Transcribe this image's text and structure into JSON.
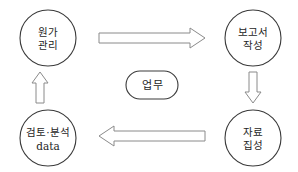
{
  "diagram": {
    "type": "cycle-flow",
    "center": {
      "label": "업무",
      "shape": "stadium"
    },
    "nodes": [
      {
        "id": "cost-management",
        "position": "top-left",
        "lines": [
          "원가",
          "관리"
        ],
        "line1": "원가",
        "line2": "관리",
        "shape": "circle"
      },
      {
        "id": "report-writing",
        "position": "top-right",
        "lines": [
          "보고서",
          "작성"
        ],
        "line1": "보고서",
        "line2": "작성",
        "shape": "circle"
      },
      {
        "id": "data-compilation",
        "position": "bottom-right",
        "lines": [
          "자료",
          "집성"
        ],
        "line1": "자료",
        "line2": "집성",
        "shape": "circle"
      },
      {
        "id": "review-analysis-data",
        "position": "bottom-left",
        "lines": [
          "검토·분석",
          "data"
        ],
        "line1": "검토·분석",
        "line2": "data",
        "shape": "circle"
      }
    ],
    "arrows": [
      {
        "id": "arrow-top",
        "direction": "right",
        "from": "cost-management",
        "to": "report-writing"
      },
      {
        "id": "arrow-right",
        "direction": "down",
        "from": "report-writing",
        "to": "data-compilation"
      },
      {
        "id": "arrow-bottom",
        "direction": "left",
        "from": "data-compilation",
        "to": "review-analysis-data"
      },
      {
        "id": "arrow-left",
        "direction": "up",
        "from": "review-analysis-data",
        "to": "cost-management"
      }
    ],
    "colors": {
      "background": "#ffffff",
      "node_stroke": "#3a3a3a",
      "arrow_stroke": "#8a8a8a",
      "text": "#1e1e1e"
    }
  }
}
